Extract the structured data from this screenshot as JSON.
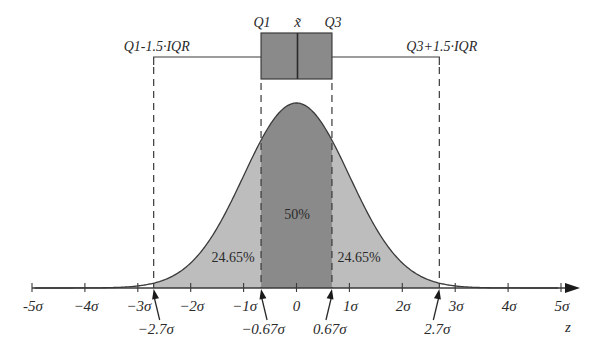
{
  "chart_data": {
    "type": "area",
    "xlabel": "z",
    "ylabel": "",
    "x_ticks": [
      "-5σ",
      "−4σ",
      "−3σ",
      "−2σ",
      "−1σ",
      "0",
      "1σ",
      "2σ",
      "3σ",
      "4σ",
      "5σ"
    ],
    "x_tick_values": [
      -5,
      -4,
      -3,
      -2,
      -1,
      0,
      1,
      2,
      3,
      4,
      5
    ],
    "xlim": [
      -5,
      5
    ],
    "boxplot": {
      "q1_label": "Q1",
      "median_label": "x̃",
      "q3_label": "Q3",
      "lower_whisker_label": "Q1-1.5·IQR",
      "upper_whisker_label": "Q3+1.5·IQR",
      "q1": -0.67,
      "median": 0,
      "q3": 0.67,
      "lower_whisker": -2.7,
      "upper_whisker": 2.7
    },
    "regions": [
      {
        "from": -2.7,
        "to": -0.67,
        "label": "24.65%",
        "value": 24.65
      },
      {
        "from": -0.67,
        "to": 0.67,
        "label": "50%",
        "value": 50
      },
      {
        "from": 0.67,
        "to": 2.7,
        "label": "24.65%",
        "value": 24.65
      }
    ],
    "marked_points": [
      {
        "value": -2.7,
        "label": "−2.7σ"
      },
      {
        "value": -0.67,
        "label": "−0.67σ"
      },
      {
        "value": 0.67,
        "label": "0.67σ"
      },
      {
        "value": 2.7,
        "label": "2.7σ"
      }
    ],
    "colors": {
      "outer_fill": "#bdbdbd",
      "inner_fill": "#8a8a8a",
      "box_fill": "#8a8a8a",
      "line": "#3a3a3a"
    }
  }
}
